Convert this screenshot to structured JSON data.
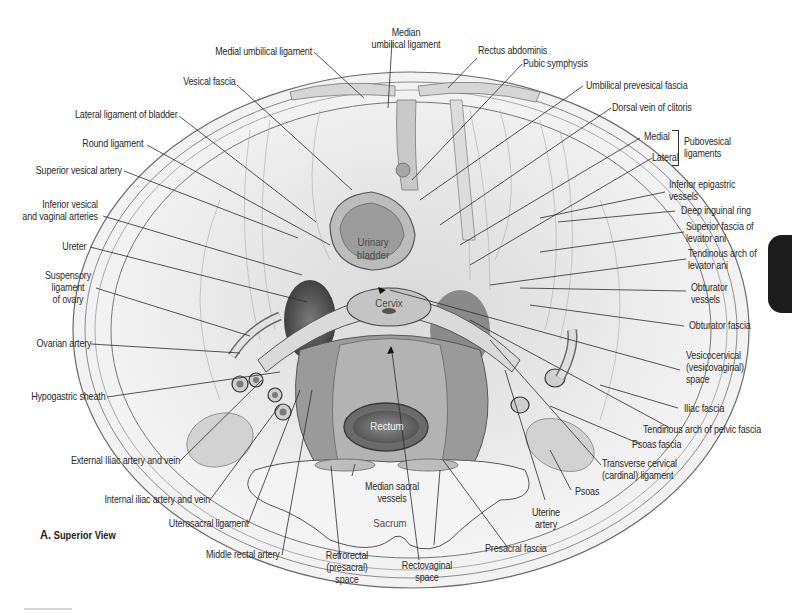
{
  "figure": {
    "caption_letter": "A.",
    "caption_text": "Superior View"
  },
  "inner_labels": {
    "bladder": "Urinary\nbladder",
    "cervix": "Cervix",
    "rectum": "Rectum",
    "sacrum": "Sacrum"
  },
  "labels": {
    "median_umbilical_ligament": "Median\numbilical ligament",
    "medial_umbilical_ligament": "Medial umbilical ligament",
    "vesical_fascia": "Vesical fascia",
    "rectus_abdominis": "Rectus abdominis",
    "pubic_symphysis": "Pubic symphysis",
    "umbilical_prevesical_fascia": "Umbilical prevesical fascia",
    "dorsal_vein_of_clitoris": "Dorsal vein of clitoris",
    "lateral_ligament_of_bladder": "Lateral ligament of bladder",
    "round_ligament": "Round ligament",
    "superior_vesical_artery": "Superior vesical artery",
    "pubovesical_medial": "Medial",
    "pubovesical_lateral": "Lateral",
    "pubovesical_ligaments": "Pubovesical\nligaments",
    "inferior_epigastric_vessels": "Inferior epigastric\nvessels",
    "deep_inguinal_ring": "Deep inguinal ring",
    "superior_fascia_levator_ani": "Superior fascia of\nlevator ani",
    "tendinous_arch_levator_ani": "Tendinous arch of\nlevator ani",
    "inferior_vesical_vaginal_arteries": "Inferior vesical\nand vaginal arteries",
    "ureter": "Ureter",
    "suspensory_ligament_ovary": "Suspensory\nligament\nof ovary",
    "obturator_vessels": "Obturator\nvessels",
    "obturator_fascia": "Obturator fascia",
    "ovarian_artery": "Ovarian artery",
    "vesicocervical_space": "Vesicocervical\n(vesicovaginal)\nspace",
    "hypogastric_sheath": "Hypogastric sheath",
    "iliac_fascia": "Iliac fascia",
    "tendinous_arch_pelvic_fascia": "Tendinous arch of pelvic fascia",
    "psoas_fascia": "Psoas fascia",
    "external_iliac": "External Iliac artery and vein",
    "transverse_cervical_ligament": "Transverse cervical\n(cardinal) ligament",
    "internal_iliac": "Internal iliac artery and vein",
    "median_sacral_vessels": "Median sacral\nvessels",
    "psoas": "Psoas",
    "uterine_artery": "Uterine\nartery",
    "uterosacral_ligament": "Uterosacral ligament",
    "middle_rectal_artery": "Middle rectal artery",
    "retrorectal_space": "Retrorectal\n(presacral)\nspace",
    "rectovaginal_space": "Rectovaginal\nspace",
    "presacral_fascia": "Presacral fascia"
  },
  "colors": {
    "line": "#2b2b2b",
    "tissue_light": "#e6e6e6",
    "tissue_mid": "#bdbdbd",
    "tissue_dark": "#6e6e6e",
    "cavity": "#3a3a3a",
    "tab": "#1c1c1c"
  }
}
